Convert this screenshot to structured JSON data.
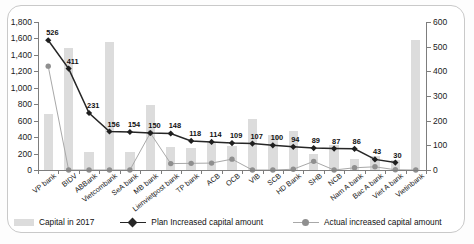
{
  "chart_data": {
    "type": "bar",
    "title": "",
    "subtitle": "",
    "xlabel": "",
    "ylabel": "",
    "ylim": [
      0,
      1800
    ],
    "y2lim": [
      0,
      600
    ],
    "grid": false,
    "legend_position": "bottom",
    "left_axis_ticks": [
      "0",
      "200",
      "400",
      "600",
      "800",
      "1,000",
      "1,200",
      "1,400",
      "1,600",
      "1,800"
    ],
    "right_axis_ticks": [
      "0",
      "100",
      "200",
      "300",
      "400",
      "500",
      "600"
    ],
    "categories": [
      "VP bank",
      "BIDV",
      "ABBank",
      "Vietcombank",
      "SeA bank",
      "MB bank",
      "Lienvietpost bank",
      "TP bank",
      "ACB",
      "OCB",
      "VIB",
      "SCB",
      "HD Bank",
      "SHB",
      "NCB",
      "Nam A bank",
      "Bac A bank",
      "Viet A bank",
      "Vietinbank"
    ],
    "series": [
      {
        "name": "Capital in 2017",
        "type": "bar",
        "axis": "left",
        "values": [
          680,
          1480,
          220,
          1560,
          220,
          790,
          280,
          270,
          340,
          290,
          620,
          430,
          470,
          200,
          300,
          140,
          170,
          120,
          1580
        ]
      },
      {
        "name": "Plan Increased capital amount",
        "type": "line",
        "axis": "right",
        "values": [
          526,
          411,
          231,
          156,
          154,
          150,
          148,
          118,
          114,
          109,
          107,
          100,
          94,
          89,
          87,
          86,
          43,
          30,
          null
        ],
        "labels": [
          "526",
          "411",
          "231",
          "156",
          "154",
          "150",
          "148",
          "118",
          "114",
          "109",
          "107",
          "100",
          "94",
          "89",
          "87",
          "86",
          "43",
          "30",
          ""
        ]
      },
      {
        "name": "Actual increased capital amount",
        "type": "line",
        "axis": "right",
        "values": [
          421,
          0,
          0,
          0,
          0,
          150,
          26,
          27,
          28,
          44,
          0,
          0,
          3,
          35,
          0,
          9,
          13,
          1,
          0
        ]
      }
    ]
  },
  "legend": {
    "items": [
      {
        "label": "Capital in 2017",
        "marker": "bar-swatch",
        "color": "#dcdcdc"
      },
      {
        "label": "Plan Increased capital amount",
        "marker": "diamond-line",
        "color": "#262626"
      },
      {
        "label": "Actual increased capital amount",
        "marker": "circle-line",
        "color": "#8f8f8f"
      }
    ]
  }
}
